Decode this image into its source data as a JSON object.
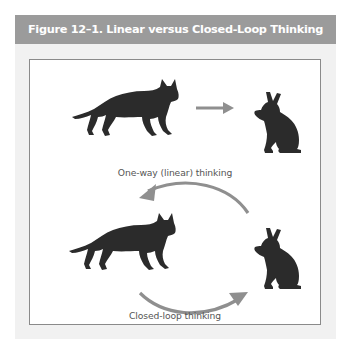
{
  "figure": {
    "title": "Figure 12–1. Linear versus Closed-Loop Thinking",
    "header_color": "#9b9b9b",
    "frame_color": "#f1f1f1",
    "silhouette_color": "#2b2b2b",
    "arrow_color": "#8f8f8f"
  },
  "panels": [
    {
      "id": "linear",
      "caption": "One-way (linear) thinking",
      "elements": [
        "fox-silhouette",
        "straight-arrow-right",
        "rabbit-silhouette"
      ]
    },
    {
      "id": "closed-loop",
      "caption": "Closed-loop thinking",
      "elements": [
        "fox-silhouette",
        "curved-arrow-to-rabbit",
        "rabbit-silhouette",
        "curved-arrow-to-fox"
      ]
    }
  ]
}
